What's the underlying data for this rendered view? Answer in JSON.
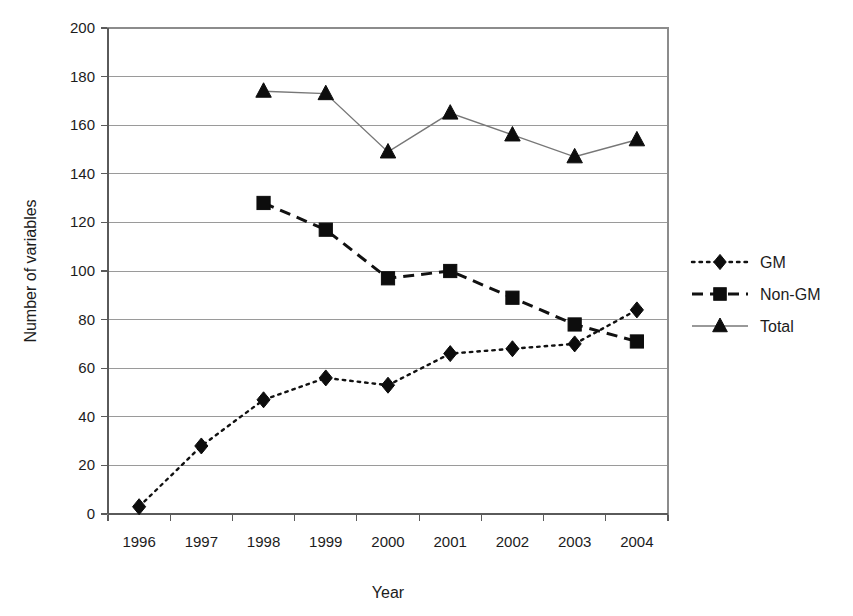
{
  "chart_data": {
    "type": "line",
    "title": "",
    "xlabel": "Year",
    "ylabel": "Number of variables",
    "categories": [
      "1996",
      "1997",
      "1998",
      "1999",
      "2000",
      "2001",
      "2002",
      "2003",
      "2004"
    ],
    "ylim": [
      0,
      200
    ],
    "ytick_step": 20,
    "yticks": [
      "0",
      "20",
      "40",
      "60",
      "80",
      "100",
      "120",
      "140",
      "160",
      "180",
      "200"
    ],
    "grid": "horizontal",
    "legend_position": "right",
    "series": [
      {
        "name": "GM",
        "marker": "diamond",
        "line_style": "dotted",
        "color": "#111111",
        "values": [
          3,
          28,
          47,
          56,
          53,
          66,
          68,
          70,
          84
        ]
      },
      {
        "name": "Non-GM",
        "marker": "square",
        "line_style": "dashed",
        "color": "#111111",
        "values": [
          null,
          null,
          128,
          117,
          97,
          100,
          89,
          78,
          71
        ]
      },
      {
        "name": "Total",
        "marker": "triangle",
        "line_style": "solid",
        "color": "#777777",
        "values": [
          null,
          null,
          174,
          173,
          149,
          165,
          156,
          147,
          154
        ]
      }
    ]
  },
  "legend": {
    "items": [
      {
        "label": "GM"
      },
      {
        "label": "Non-GM"
      },
      {
        "label": "Total"
      }
    ]
  },
  "axes": {
    "x_title": "Year",
    "y_title": "Number of variables"
  }
}
